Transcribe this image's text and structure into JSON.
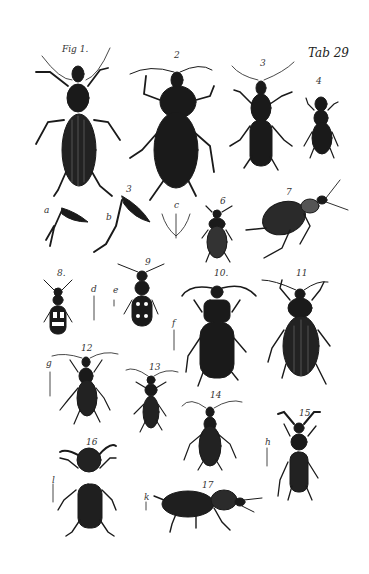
{
  "plate": {
    "title": "Tab 29",
    "fig_prefix": "Fig 1.",
    "background": "#ffffff",
    "ink": "#1a1a1a"
  },
  "figures": [
    {
      "label": "Fig 1.",
      "x": 62,
      "y": 44
    },
    {
      "label": "2",
      "x": 174,
      "y": 50
    },
    {
      "label": "3",
      "x": 260,
      "y": 58
    },
    {
      "label": "4",
      "x": 316,
      "y": 76
    },
    {
      "label": "a",
      "x": 44,
      "y": 205
    },
    {
      "label": "b",
      "x": 106,
      "y": 212
    },
    {
      "label": "3",
      "x": 126,
      "y": 184
    },
    {
      "label": "c",
      "x": 174,
      "y": 200
    },
    {
      "label": "6",
      "x": 220,
      "y": 196
    },
    {
      "label": "7",
      "x": 286,
      "y": 187
    },
    {
      "label": "8.",
      "x": 57,
      "y": 268
    },
    {
      "label": "d",
      "x": 91,
      "y": 284
    },
    {
      "label": "e",
      "x": 113,
      "y": 285
    },
    {
      "label": "9",
      "x": 145,
      "y": 257
    },
    {
      "label": "10.",
      "x": 214,
      "y": 268
    },
    {
      "label": "11",
      "x": 296,
      "y": 268
    },
    {
      "label": "f",
      "x": 172,
      "y": 318
    },
    {
      "label": "12",
      "x": 81,
      "y": 343
    },
    {
      "label": "g",
      "x": 46,
      "y": 358
    },
    {
      "label": "13",
      "x": 149,
      "y": 362
    },
    {
      "label": "14",
      "x": 210,
      "y": 390
    },
    {
      "label": "15",
      "x": 299,
      "y": 408
    },
    {
      "label": "h",
      "x": 265,
      "y": 437
    },
    {
      "label": "16",
      "x": 86,
      "y": 437
    },
    {
      "label": "l",
      "x": 52,
      "y": 475
    },
    {
      "label": "k",
      "x": 144,
      "y": 492
    },
    {
      "label": "17",
      "x": 202,
      "y": 480
    }
  ]
}
